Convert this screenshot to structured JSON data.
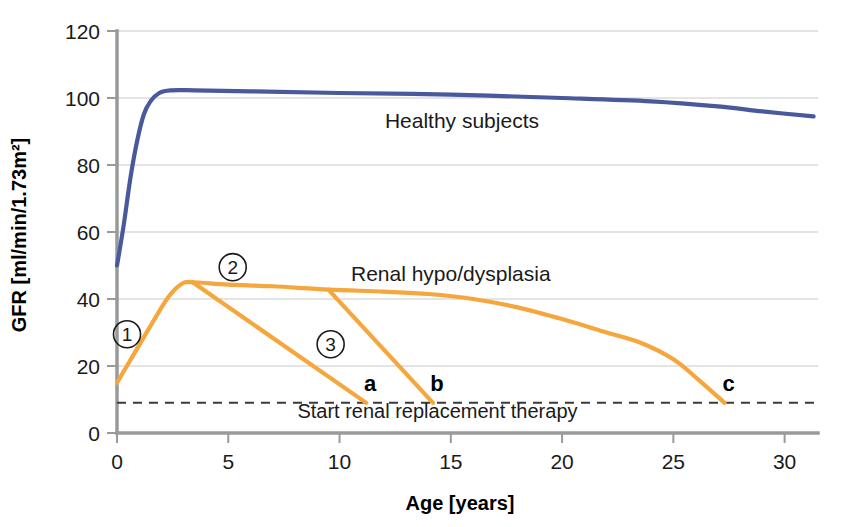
{
  "chart_data": {
    "type": "line",
    "title": "",
    "xlabel": "Age [years]",
    "ylabel": "GFR [ml/min/1.73m²]",
    "xlim": [
      0,
      31.5
    ],
    "ylim": [
      0,
      120
    ],
    "xticks": [
      0,
      5,
      10,
      15,
      20,
      25,
      30
    ],
    "xtick_labels": [
      "0",
      "5",
      "10",
      "15",
      "20",
      "25",
      "30"
    ],
    "yticks": [
      0,
      20,
      40,
      60,
      80,
      100,
      120
    ],
    "ytick_labels": [
      "0",
      "20",
      "40",
      "60",
      "80",
      "100",
      "120"
    ],
    "grid": "horizontal",
    "legend": "inline-annotations",
    "series": [
      {
        "name": "Healthy subjects",
        "color": "#4a589c",
        "label_x": 15.5,
        "label_y": 91,
        "points": [
          [
            0.0,
            50
          ],
          [
            0.3,
            62
          ],
          [
            0.6,
            76
          ],
          [
            0.9,
            87
          ],
          [
            1.2,
            95
          ],
          [
            1.5,
            99
          ],
          [
            1.9,
            101.5
          ],
          [
            2.4,
            102.3
          ],
          [
            3.5,
            102.3
          ],
          [
            6.0,
            102.0
          ],
          [
            10.0,
            101.5
          ],
          [
            15.0,
            101.0
          ],
          [
            20.0,
            100.0
          ],
          [
            24.0,
            99.0
          ],
          [
            27.0,
            97.5
          ],
          [
            29.0,
            96.0
          ],
          [
            31.3,
            94.5
          ]
        ]
      },
      {
        "name": "Renal hypo/dysplasia",
        "color": "#f5a63c",
        "label_x": 15.0,
        "label_y": 45.5,
        "points": [
          [
            0.0,
            15
          ],
          [
            0.8,
            24
          ],
          [
            1.6,
            33
          ],
          [
            2.3,
            40.5
          ],
          [
            2.9,
            44.5
          ],
          [
            3.4,
            45.0
          ],
          [
            5.0,
            44.3
          ],
          [
            7.0,
            43.8
          ],
          [
            9.5,
            42.8
          ],
          [
            12.0,
            42.2
          ],
          [
            14.0,
            41.5
          ],
          [
            16.0,
            40.0
          ],
          [
            18.0,
            37.5
          ],
          [
            20.0,
            34.0
          ],
          [
            22.0,
            30.0
          ],
          [
            23.5,
            27.0
          ],
          [
            25.0,
            22.0
          ],
          [
            26.2,
            15.5
          ],
          [
            27.3,
            9.0
          ]
        ]
      }
    ],
    "branches": [
      {
        "name": "branch-a",
        "color": "#f5a63c",
        "endpoint_label": "a",
        "points": [
          [
            3.4,
            45.0
          ],
          [
            11.2,
            9.0
          ]
        ]
      },
      {
        "name": "branch-b",
        "color": "#f5a63c",
        "endpoint_label": "b",
        "points": [
          [
            9.5,
            42.8
          ],
          [
            14.2,
            9.0
          ]
        ]
      }
    ],
    "threshold": {
      "value": 9,
      "label": "Start renal replacement therapy",
      "style": "dashed",
      "color": "#3a3a3a",
      "label_x": 14.4,
      "label_y": 4.5
    },
    "markers": [
      {
        "label": "a",
        "x": 11.2,
        "y": 9
      },
      {
        "label": "b",
        "x": 14.2,
        "y": 9
      },
      {
        "label": "c",
        "x": 27.3,
        "y": 9
      }
    ],
    "annotations": [
      {
        "label": "1",
        "glyph": "①",
        "x": 0.45,
        "y": 29.5,
        "desc": "circled-one"
      },
      {
        "label": "2",
        "glyph": "②",
        "x": 5.2,
        "y": 49.5,
        "desc": "circled-two"
      },
      {
        "label": "3",
        "glyph": "③",
        "x": 9.6,
        "y": 26.5,
        "desc": "circled-three"
      }
    ],
    "colors": {
      "healthy": "#4a589c",
      "renal": "#f5a63c",
      "grid": "#c9c9c9",
      "axis": "#9a9a9a",
      "text": "#1a1a1a"
    }
  }
}
